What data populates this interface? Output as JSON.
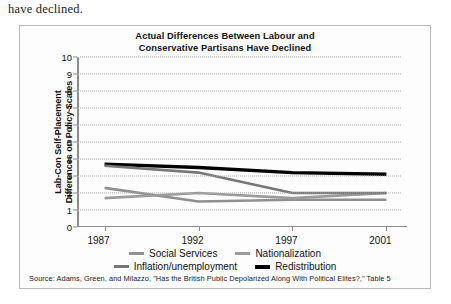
{
  "page": {
    "body_text": "have declined."
  },
  "figure": {
    "title_line1": "Actual Differences Between Labour and",
    "title_line2": "Conservative Partisans Have Declined",
    "source": "Source: Adams, Green, and Milazzo, \"Has the British Public Depolarized Along With Political Elites?,\" Table 5"
  },
  "legend": {
    "items": [
      {
        "label": "Social Services",
        "color": "#8f8f8f",
        "thick": false
      },
      {
        "label": "Nationalization",
        "color": "#9b9b9b",
        "thick": false
      },
      {
        "label": "Inflation/unemployment",
        "color": "#777777",
        "thick": false
      },
      {
        "label": "Redistribution",
        "color": "#000000",
        "thick": true
      }
    ]
  },
  "chart_data": {
    "type": "line",
    "title": "Actual Differences Between Labour and Conservative Partisans Have Declined",
    "xlabel": "",
    "ylabel": "Lab-Con Self-Placement Differences on Policy Scales",
    "categories": [
      "1987",
      "1992",
      "1997",
      "2001"
    ],
    "x": [
      1987,
      1992,
      1997,
      2001
    ],
    "ylim": [
      0,
      10
    ],
    "yticks": [
      0,
      1,
      2,
      3,
      4,
      5,
      6,
      7,
      8,
      9,
      10
    ],
    "grid": true,
    "legend_position": "bottom",
    "series": [
      {
        "name": "Redistribution",
        "values": [
          3.7,
          3.5,
          3.2,
          3.1
        ],
        "color": "#000000"
      },
      {
        "name": "Social Services",
        "values": [
          2.3,
          1.5,
          1.6,
          1.6
        ],
        "color": "#8f8f8f"
      },
      {
        "name": "Nationalization",
        "values": [
          1.7,
          2.0,
          1.7,
          2.0
        ],
        "color": "#9b9b9b"
      },
      {
        "name": "Inflation/unemployment",
        "values": [
          3.6,
          3.2,
          2.0,
          2.0
        ],
        "color": "#777777"
      }
    ]
  }
}
